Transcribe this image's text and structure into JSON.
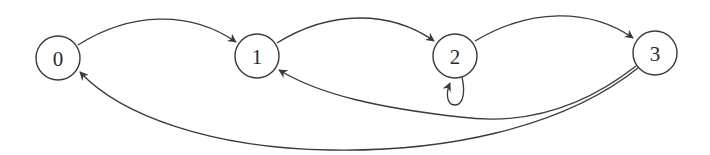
{
  "diagram": {
    "type": "state-transition-graph",
    "colors": {
      "stroke": "#3a3a3a",
      "text": "#2a2a2a",
      "background": "#ffffff"
    },
    "nodes": [
      {
        "id": "0",
        "label": "0",
        "cx": 58,
        "cy": 58
      },
      {
        "id": "1",
        "label": "1",
        "cx": 257,
        "cy": 56
      },
      {
        "id": "2",
        "label": "2",
        "cx": 455,
        "cy": 56
      },
      {
        "id": "3",
        "label": "3",
        "cx": 655,
        "cy": 53
      }
    ],
    "edges": [
      {
        "from": "0",
        "to": "1",
        "kind": "forward-arc-top"
      },
      {
        "from": "1",
        "to": "2",
        "kind": "forward-arc-top"
      },
      {
        "from": "2",
        "to": "3",
        "kind": "forward-arc-top"
      },
      {
        "from": "2",
        "to": "2",
        "kind": "self-loop-bottom"
      },
      {
        "from": "3",
        "to": "1",
        "kind": "backward-arc-bottom"
      },
      {
        "from": "3",
        "to": "0",
        "kind": "backward-arc-bottom"
      }
    ]
  }
}
